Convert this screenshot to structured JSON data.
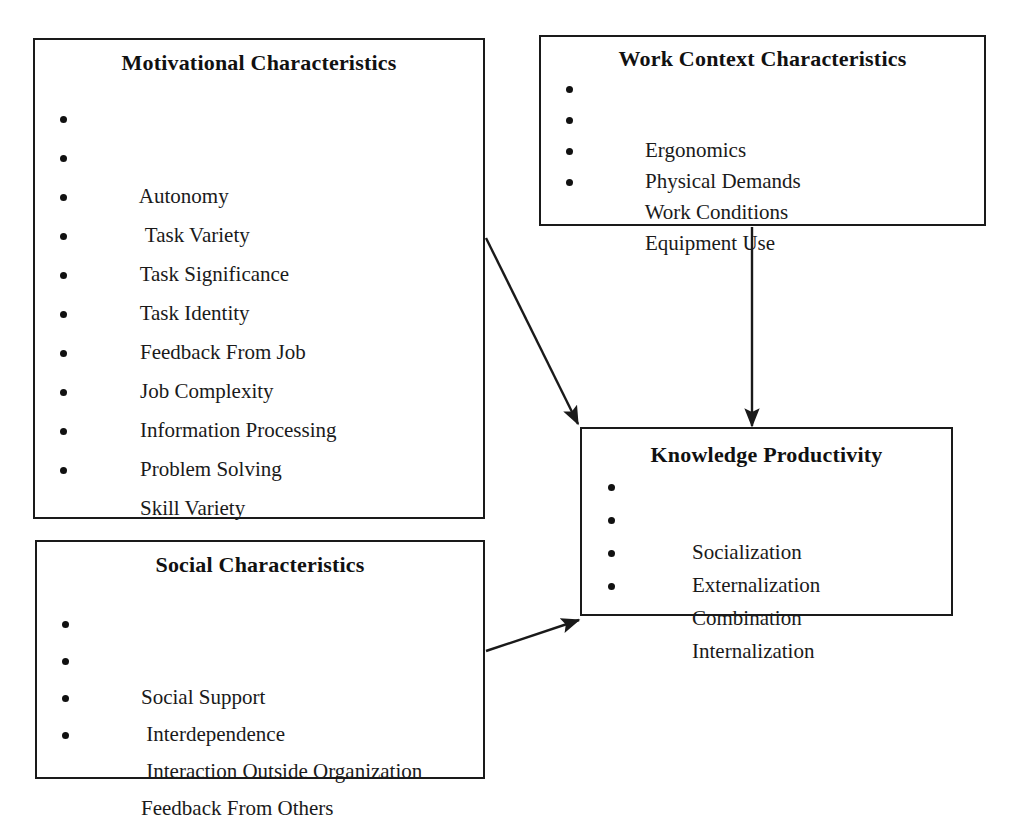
{
  "diagram": {
    "background_color": "#ffffff",
    "line_color": "#1a1a1a",
    "nodes": {
      "motivational": {
        "title": "Motivational Characteristics",
        "items": [
          "Autonomy",
          " Task Variety",
          "Task Significance",
          "Task Identity",
          "Feedback From Job",
          "Job Complexity",
          "Information Processing",
          "Problem Solving",
          "Skill Variety",
          "Specialization"
        ]
      },
      "work_context": {
        "title": "Work Context Characteristics",
        "items": [
          "Ergonomics",
          "Physical Demands",
          "Work Conditions",
          "Equipment Use"
        ]
      },
      "social": {
        "title": "Social Characteristics",
        "items": [
          "Social Support",
          " Interdependence",
          " Interaction Outside Organization",
          "Feedback From Others"
        ]
      },
      "knowledge": {
        "title": "Knowledge Productivity",
        "items": [
          "Socialization",
          "Externalization",
          "Combination",
          "Internalization"
        ]
      }
    },
    "connectors": [
      {
        "name": "motivational-to-knowledge",
        "from": "motivational",
        "to": "knowledge",
        "style": "straight-diagonal-arrow"
      },
      {
        "name": "work-context-to-knowledge",
        "from": "work_context",
        "to": "knowledge",
        "style": "straight-vertical-arrow"
      },
      {
        "name": "social-to-knowledge",
        "from": "social",
        "to": "knowledge",
        "style": "straight-diagonal-arrow"
      }
    ]
  }
}
